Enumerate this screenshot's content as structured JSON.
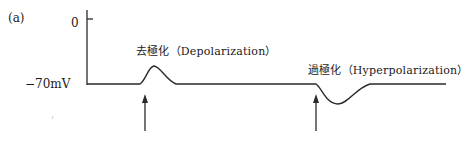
{
  "figure": {
    "panel_label": "(a)",
    "y_axis": {
      "ticks": [
        {
          "label": "0"
        },
        {
          "label": "−70mV"
        }
      ]
    },
    "events": [
      {
        "name": "depolarization",
        "label": "去極化（Depolarization）",
        "direction": "up",
        "stimulus_arrow": true
      },
      {
        "name": "hyperpolarization",
        "label": "過極化（Hyperpolarization）",
        "direction": "down",
        "stimulus_arrow": true
      }
    ],
    "colors": {
      "line": "#2a2a2a",
      "background": "#ffffff"
    }
  }
}
